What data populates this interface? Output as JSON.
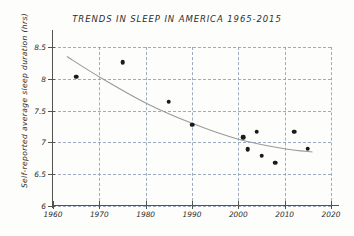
{
  "chart_data": {
    "type": "scatter",
    "title": "TRENDS IN SLEEP IN AMERICA 1965-2015",
    "xlabel": "",
    "ylabel": "Self-reported average sleep duration (hrs)",
    "xlim": [
      1960,
      2020
    ],
    "ylim": [
      6,
      8.5
    ],
    "xticks": [
      "1960",
      "1970",
      "1980",
      "1990",
      "2000",
      "2010",
      "2020"
    ],
    "yticks": [
      "6",
      "6.5",
      "7",
      "7.5",
      "8",
      "8.5"
    ],
    "grid": true,
    "legend": "none",
    "marker_color": "#1a1a1a",
    "grid_color": "#8d9fb4",
    "trend_color": "#9a9a9a",
    "points": [
      {
        "x": 1965,
        "y": 8.03
      },
      {
        "x": 1975,
        "y": 8.26
      },
      {
        "x": 1985,
        "y": 7.64
      },
      {
        "x": 1990,
        "y": 7.28
      },
      {
        "x": 2001,
        "y": 7.08
      },
      {
        "x": 2002,
        "y": 6.89
      },
      {
        "x": 2004,
        "y": 7.17
      },
      {
        "x": 2005,
        "y": 6.79
      },
      {
        "x": 2008,
        "y": 6.68
      },
      {
        "x": 2012,
        "y": 7.17
      },
      {
        "x": 2015,
        "y": 6.9
      }
    ],
    "trend_line": [
      {
        "x": 1963,
        "y": 8.35
      },
      {
        "x": 1970,
        "y": 8.03
      },
      {
        "x": 1980,
        "y": 7.62
      },
      {
        "x": 1990,
        "y": 7.3
      },
      {
        "x": 2000,
        "y": 7.05
      },
      {
        "x": 2010,
        "y": 6.9
      },
      {
        "x": 2016,
        "y": 6.85
      }
    ]
  }
}
